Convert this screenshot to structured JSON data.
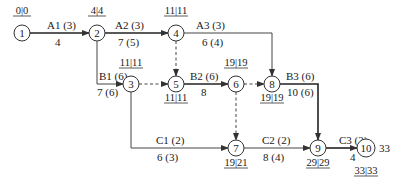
{
  "diagram": {
    "type": "activity-on-arrow network (critical path)",
    "nodes": [
      {
        "id": "1",
        "label": "1",
        "x": 22,
        "y": 33,
        "times": "0|0",
        "times_pos": "above"
      },
      {
        "id": "2",
        "label": "2",
        "x": 97,
        "y": 33,
        "times": "4|4",
        "times_pos": "above"
      },
      {
        "id": "3",
        "label": "3",
        "x": 131,
        "y": 84,
        "times": "11|11",
        "times_pos": "above"
      },
      {
        "id": "4",
        "label": "4",
        "x": 176,
        "y": 33,
        "times": "11|11",
        "times_pos": "above"
      },
      {
        "id": "5",
        "label": "5",
        "x": 176,
        "y": 84,
        "times": "11|11",
        "times_pos": "below"
      },
      {
        "id": "6",
        "label": "6",
        "x": 236,
        "y": 84,
        "times": "19|19",
        "times_pos": "above"
      },
      {
        "id": "7",
        "label": "7",
        "x": 236,
        "y": 148,
        "times": "19|21",
        "times_pos": "below"
      },
      {
        "id": "8",
        "label": "8",
        "x": 272,
        "y": 84,
        "times": "19|19",
        "times_pos": "below"
      },
      {
        "id": "9",
        "label": "9",
        "x": 318,
        "y": 148,
        "times": "29|29",
        "times_pos": "below"
      },
      {
        "id": "10",
        "label": "10",
        "x": 366,
        "y": 148,
        "times": "33|33",
        "times_pos": "below"
      }
    ],
    "activities": [
      {
        "name": "A1 (3)",
        "duration": "4",
        "from": "1",
        "to": "2"
      },
      {
        "name": "A2 (3)",
        "duration": "7 (5)",
        "from": "2",
        "to": "4"
      },
      {
        "name": "A3 (3)",
        "duration": "6 (4)",
        "from": "4",
        "to": "8"
      },
      {
        "name": "B1 (6)",
        "duration": "7 (6)",
        "from": "2",
        "to": "3"
      },
      {
        "name": "B2 (6)",
        "duration": "8",
        "from": "5",
        "to": "6"
      },
      {
        "name": "B3 (6)",
        "duration": "10 (6)",
        "from": "8",
        "to": "9"
      },
      {
        "name": "C1 (2)",
        "duration": "6 (3)",
        "from": "3",
        "to": "7"
      },
      {
        "name": "C2 (2)",
        "duration": "8 (4)",
        "from": "7",
        "to": "9"
      },
      {
        "name": "C3 (2)",
        "duration": "4",
        "from": "9",
        "to": "10"
      }
    ],
    "dummies": [
      {
        "from": "4",
        "to": "5"
      },
      {
        "from": "3",
        "to": "5"
      },
      {
        "from": "6",
        "to": "8"
      },
      {
        "from": "6",
        "to": "7"
      }
    ],
    "project_duration": "33"
  }
}
